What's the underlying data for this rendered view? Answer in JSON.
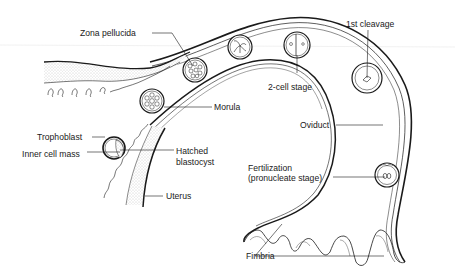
{
  "diagram": {
    "colors": {
      "line": "#1a1a1a",
      "stipple": "#bdbdbd",
      "background": "#ffffff"
    },
    "labels": {
      "zona_pellucida": "Zona pellucida",
      "first_cleavage": "1st cleavage",
      "two_cell_stage": "2-cell stage",
      "morula": "Morula",
      "oviduct": "Oviduct",
      "trophoblast": "Trophoblast",
      "inner_cell_mass": "Inner cell mass",
      "hatched_blastocyst_1": "Hatched",
      "hatched_blastocyst_2": "blastocyst",
      "uterus": "Uterus",
      "fertilization_1": "Fertilization",
      "fertilization_2": "(pronucleate stage)",
      "fimbria": "Fimbria"
    },
    "stages_in_order": [
      "Fertilization (pronucleate stage)",
      "1st cleavage",
      "2-cell stage",
      "4-cell stage",
      "Morula (Zona pellucida)",
      "Morula",
      "Hatched blastocyst"
    ]
  }
}
